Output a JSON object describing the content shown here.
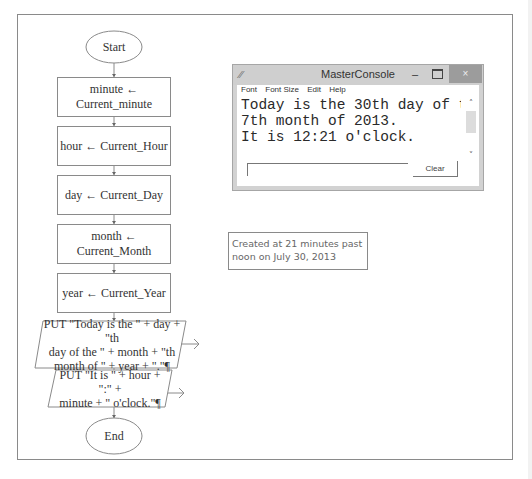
{
  "flowchart": {
    "start_label": "Start",
    "end_label": "End",
    "steps": [
      {
        "type": "assignment",
        "lines": [
          "minute ←",
          "Current_minute"
        ]
      },
      {
        "type": "assignment",
        "lines": [
          "hour ← Current_Hour"
        ]
      },
      {
        "type": "assignment",
        "lines": [
          "day ← Current_Day"
        ]
      },
      {
        "type": "assignment",
        "lines": [
          "month ← Current_Month"
        ]
      },
      {
        "type": "assignment",
        "lines": [
          "year ← Current_Year"
        ]
      },
      {
        "type": "output",
        "lines": [
          "PUT \"Today is the \" + day + \"th",
          "day of the \" + month + \"th",
          "month of \" + year + \".\"¶"
        ]
      },
      {
        "type": "output",
        "lines": [
          "PUT \"It is \" + hour + \":\" +",
          "minute + \" o'clock.\"¶"
        ]
      }
    ]
  },
  "console_window": {
    "title": "MasterConsole",
    "icon": "raptor-icon",
    "minimize_glyph": "–",
    "close_glyph": "×",
    "menu": [
      "Font",
      "Font Size",
      "Edit",
      "Help"
    ],
    "output_lines": [
      "Today is the 30th day of the",
      "7th month of 2013.",
      "It is 12:21 o'clock."
    ],
    "input_value": "",
    "clear_label": "Clear",
    "scroll_up_glyph": "˄",
    "scroll_down_glyph": "˅"
  },
  "note": {
    "line1": "Created at 21 minutes past",
    "line2": "noon on July 30, 2013"
  }
}
